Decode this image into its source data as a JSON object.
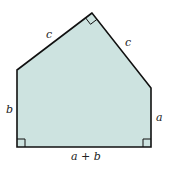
{
  "diagram": {
    "type": "pentagon-figure",
    "fill_color": "#cde3e0",
    "stroke_color": "#111111",
    "labels": {
      "left_side": "b",
      "right_side": "a",
      "bottom_side": "a + b",
      "top_left_side": "c",
      "top_right_side": "c"
    },
    "right_angle_markers": [
      "apex",
      "bottom-left",
      "bottom-right"
    ]
  }
}
